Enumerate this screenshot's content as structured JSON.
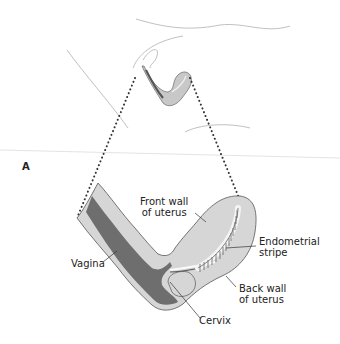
{
  "figure": {
    "panel_label": "A",
    "colors": {
      "outline": "#555555",
      "body_line": "#aaaaaa",
      "tissue_light": "#d4d4d4",
      "canal_dark": "#6e6e6e",
      "stripe": "#f2f2f2",
      "dotted": "#333333"
    },
    "labels": {
      "front_wall_1": "Front wall",
      "front_wall_2": "of uterus",
      "endometrial_1": "Endometrial",
      "endometrial_2": "stripe",
      "vagina": "Vagina",
      "back_wall_1": "Back wall",
      "back_wall_2": "of uterus",
      "cervix": "Cervix"
    }
  }
}
